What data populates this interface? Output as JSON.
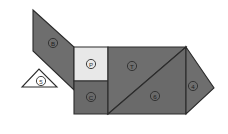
{
  "figure": {
    "canvas": {
      "width": 228,
      "height": 134
    },
    "background_color": "#ffffff",
    "outline_color": "#2b2b2b"
  },
  "palette": {
    "dark_gray": "#6e6e6e",
    "mid_gray": "#6a6a6a",
    "light_gray": "#e8e8e8",
    "white": "#ffffff",
    "stroke": "#2b2b2b",
    "label_ink": "#2a2a2a"
  },
  "pieces": [
    {
      "id": "piece-parallelogram-head",
      "name": "parallelogram",
      "label": "B",
      "fill": "#6e6e6e",
      "points": "33,10 74,47 74,90 33,51",
      "label_x": 53,
      "label_y": 43,
      "label_tone": "on-dark"
    },
    {
      "id": "piece-triangle-snout",
      "name": "small-triangle",
      "label": "5",
      "fill": "#ffffff",
      "points": "22,87 57,87 39,69",
      "label_x": 41,
      "label_y": 81,
      "label_tone": "on-light"
    },
    {
      "id": "piece-square-body",
      "name": "square",
      "label": "P",
      "fill": "#e8e8e8",
      "points": "74,47 108,47 108,81 74,81",
      "label_x": 91,
      "label_y": 64,
      "label_tone": "on-light"
    },
    {
      "id": "piece-triangle-neck",
      "name": "small-triangle",
      "label": "C",
      "fill": "#6a6a6a",
      "points": "74,81 108,81 108,114 74,114",
      "label_x": 91,
      "label_y": 97,
      "label_tone": "on-dark"
    },
    {
      "id": "piece-large-triangle-upper",
      "name": "large-triangle",
      "label": "T",
      "fill": "#6e6e6e",
      "points": "108,47 186,47 108,114",
      "label_x": 132,
      "label_y": 66,
      "label_tone": "on-dark"
    },
    {
      "id": "piece-large-triangle-lower",
      "name": "large-triangle",
      "label": "6",
      "fill": "#6a6a6a",
      "points": "108,114 186,114 186,47",
      "label_x": 155,
      "label_y": 96,
      "label_tone": "on-dark"
    },
    {
      "id": "piece-triangle-tail",
      "name": "medium-triangle",
      "label": "4",
      "fill": "#6e6e6e",
      "points": "186,47 214,88 186,114",
      "label_x": 193,
      "label_y": 86,
      "label_tone": "on-dark"
    }
  ]
}
